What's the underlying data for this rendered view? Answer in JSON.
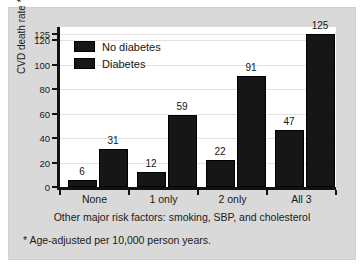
{
  "figure": {
    "background_color": "#d9d9d9",
    "plot_background_color": "#ffffff",
    "axis_color": "#121212",
    "bar_color": "#161616"
  },
  "legend": {
    "position": "inside-top-left",
    "items": [
      {
        "label": "No diabetes",
        "color": "#161616"
      },
      {
        "label": "Diabetes",
        "color": "#161616"
      }
    ]
  },
  "axes": {
    "ylabel": "CVD death rate *",
    "xlabel": "Other major risk factors: smoking, SBP, and cholesterol",
    "yticks": [
      0,
      20,
      40,
      60,
      80,
      100,
      120,
      125
    ],
    "ytick_labels": [
      "0",
      "20",
      "40",
      "60",
      "80",
      "100",
      "120",
      "125"
    ]
  },
  "footnote": "* Age-adjusted per 10,000 person years.",
  "chart_data": {
    "type": "bar",
    "title": "",
    "subtitle": "",
    "xlabel": "Other major risk factors: smoking, SBP, and cholesterol",
    "ylabel": "CVD death rate *",
    "categories": [
      "None",
      "1 only",
      "2 only",
      "All 3"
    ],
    "series": [
      {
        "name": "No diabetes",
        "values": [
          6,
          12,
          22,
          47
        ],
        "color": "#161616"
      },
      {
        "name": "Diabetes",
        "values": [
          31,
          59,
          91,
          125
        ],
        "color": "#161616"
      }
    ],
    "data_labels": [
      [
        "6",
        "31"
      ],
      [
        "12",
        "59"
      ],
      [
        "22",
        "91"
      ],
      [
        "47",
        "125"
      ]
    ],
    "ylim": [
      0,
      131
    ],
    "yticks": [
      0,
      20,
      40,
      60,
      80,
      100,
      120,
      125
    ],
    "grid": true,
    "grid_axis": "y",
    "legend": [
      "No diabetes",
      "Diabetes"
    ],
    "legend_position": "upper left inside axes",
    "annotations": [
      "* Age-adjusted per 10,000 person years."
    ]
  }
}
